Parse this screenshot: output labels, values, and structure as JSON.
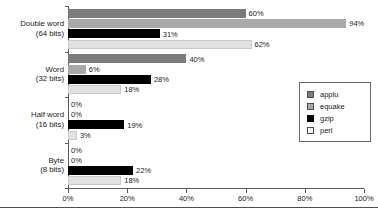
{
  "chart_data": {
    "type": "bar",
    "orientation": "horizontal",
    "title": "",
    "xlabel": "",
    "ylabel": "",
    "xlim": [
      0,
      100
    ],
    "xticks": [
      "0%",
      "20%",
      "40%",
      "60%",
      "80%",
      "100%"
    ],
    "xtick_values": [
      0,
      20,
      40,
      60,
      80,
      100
    ],
    "grid": false,
    "legend_position": "right",
    "categories": [
      "Double word\n(64 bits)",
      "Word\n(32 bits)",
      "Half word\n(16 bits)",
      "Byte\n(8 bits)"
    ],
    "category_lines": [
      [
        "Double word",
        "(64 bits)"
      ],
      [
        "Word",
        "(32 bits)"
      ],
      [
        "Half word",
        "(16 bits)"
      ],
      [
        "Byte",
        "(8 bits)"
      ]
    ],
    "series": [
      {
        "name": "applu",
        "color": "#7c7c7c",
        "values": [
          60,
          40,
          0,
          0
        ],
        "labels": [
          "60%",
          "40%",
          "0%",
          "0%"
        ]
      },
      {
        "name": "equake",
        "color": "#a9a9a9",
        "values": [
          94,
          6,
          0,
          0
        ],
        "labels": [
          "94%",
          "6%",
          "0%",
          "0%"
        ]
      },
      {
        "name": "gzip",
        "color": "#000000",
        "values": [
          31,
          28,
          19,
          22
        ],
        "labels": [
          "31%",
          "28%",
          "19%",
          "22%"
        ]
      },
      {
        "name": "perl",
        "color": "#e2e2e2",
        "values": [
          62,
          18,
          3,
          18
        ],
        "labels": [
          "62%",
          "18%",
          "3%",
          "18%"
        ]
      }
    ]
  },
  "legend": {
    "entries": [
      {
        "label": "applu"
      },
      {
        "label": "equake"
      },
      {
        "label": "gzip"
      },
      {
        "label": "perl"
      }
    ]
  }
}
